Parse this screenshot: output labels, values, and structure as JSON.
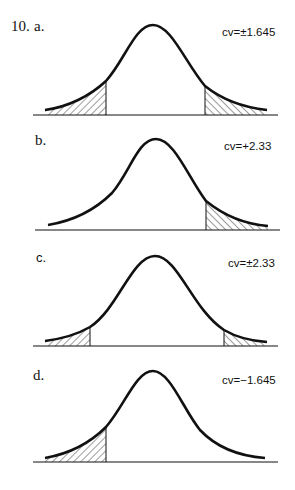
{
  "problem_number": "10.",
  "panels": [
    {
      "label": "a.",
      "cv_text": "cv=±1.645",
      "tails": "two-tailed",
      "critical_values": [
        -1.645,
        1.645
      ]
    },
    {
      "label": "b.",
      "cv_text": "cv=+2.33",
      "tails": "right-tailed",
      "critical_values": [
        2.33
      ]
    },
    {
      "label": "c.",
      "cv_text": "cv=±2.33",
      "tails": "two-tailed",
      "critical_values": [
        -2.33,
        2.33
      ]
    },
    {
      "label": "d.",
      "cv_text": "cv=−1.645",
      "tails": "left-tailed",
      "critical_values": [
        -1.645
      ]
    }
  ]
}
